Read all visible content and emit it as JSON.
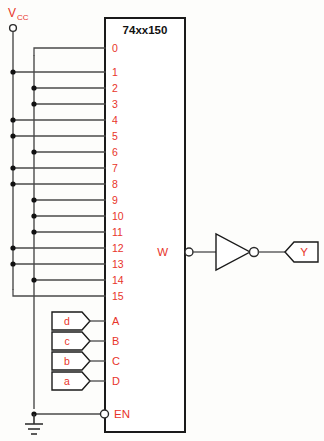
{
  "chip": {
    "part_number": "74xx150",
    "data_inputs": [
      {
        "label": "0",
        "source": "GND"
      },
      {
        "label": "1",
        "source": "VCC"
      },
      {
        "label": "2",
        "source": "GND"
      },
      {
        "label": "3",
        "source": "GND"
      },
      {
        "label": "4",
        "source": "VCC"
      },
      {
        "label": "5",
        "source": "VCC"
      },
      {
        "label": "6",
        "source": "GND"
      },
      {
        "label": "7",
        "source": "VCC"
      },
      {
        "label": "8",
        "source": "VCC"
      },
      {
        "label": "9",
        "source": "GND"
      },
      {
        "label": "10",
        "source": "GND"
      },
      {
        "label": "11",
        "source": "GND"
      },
      {
        "label": "12",
        "source": "VCC"
      },
      {
        "label": "13",
        "source": "VCC"
      },
      {
        "label": "14",
        "source": "GND"
      },
      {
        "label": "15",
        "source": "VCC"
      }
    ],
    "select_inputs": [
      {
        "pin": "A",
        "signal": "d"
      },
      {
        "pin": "B",
        "signal": "c"
      },
      {
        "pin": "C",
        "signal": "b"
      },
      {
        "pin": "D",
        "signal": "a"
      }
    ],
    "enable": {
      "label": "EN",
      "active_low": true,
      "tied_to": "GND"
    },
    "output": {
      "label": "W",
      "active_low": true
    }
  },
  "power": {
    "vcc_label": "V",
    "vcc_subscript": "CC"
  },
  "inverter": {
    "name": "not-gate"
  },
  "final_output": {
    "label": "Y"
  },
  "colors": {
    "label_red": "#e8342a",
    "wire_gray": "#4a4a4a",
    "outline_black": "#1a1a1a",
    "background": "#fdfdfb"
  }
}
